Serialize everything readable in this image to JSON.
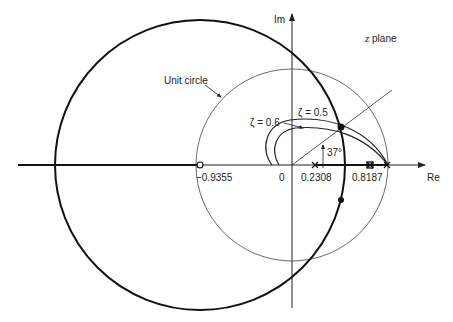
{
  "diagram": {
    "title": "z plane",
    "axes": {
      "real_label": "Re",
      "imag_label": "Im",
      "origin_label": "0"
    },
    "annotations": {
      "unit_circle": "Unit circle",
      "zeta_05": "ζ = 0.5",
      "zeta_06": "ζ = 0.6",
      "angle": "37°"
    },
    "points": {
      "zero_label": "−0.9355",
      "pole1_label": "0.2308",
      "pole2_label": "0.8187"
    },
    "plane_name_italic": "z",
    "plane_name_rest": " plane"
  }
}
